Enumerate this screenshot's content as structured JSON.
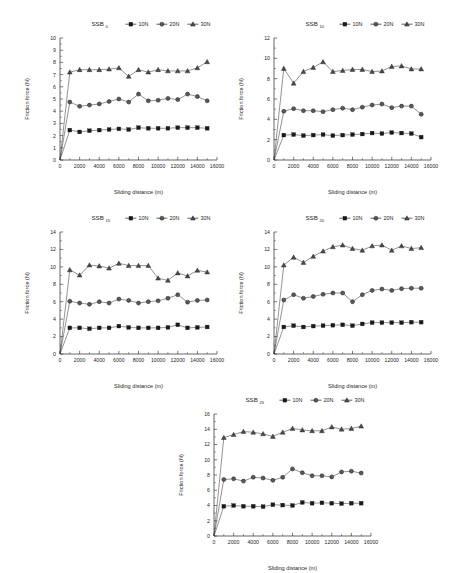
{
  "figure": {
    "axis_titles": {
      "x": "Sliding distance (m)",
      "y": "Friction force (N)"
    },
    "legend": [
      {
        "key": "10N",
        "label": "10N",
        "marker": "square"
      },
      {
        "key": "20N",
        "label": "20N",
        "marker": "circle"
      },
      {
        "key": "30N",
        "label": "30N",
        "marker": "triangle"
      }
    ]
  },
  "chart_data": [
    {
      "type": "line",
      "panel_id": "panel-1",
      "title": "SSB",
      "title_subscript": "0",
      "xlabel": "Sliding distance (m)",
      "ylabel": "Friction force (N)",
      "xlim": [
        0,
        16000
      ],
      "ylim": [
        0,
        10
      ],
      "xticks": [
        0,
        2000,
        4000,
        6000,
        8000,
        10000,
        12000,
        14000,
        16000
      ],
      "yticks": [
        0,
        1,
        2,
        3,
        4,
        5,
        6,
        7,
        8,
        9,
        10
      ],
      "grid": false,
      "legend_position": "top",
      "x": [
        0,
        1000,
        2000,
        3000,
        4000,
        5000,
        6000,
        7000,
        8000,
        9000,
        10000,
        11000,
        12000,
        13000,
        14000,
        15000
      ],
      "series": [
        {
          "name": "10N",
          "marker": "square",
          "values": [
            0,
            2.45,
            2.3,
            2.4,
            2.45,
            2.5,
            2.55,
            2.5,
            2.65,
            2.6,
            2.6,
            2.6,
            2.65,
            2.65,
            2.65,
            2.6
          ]
        },
        {
          "name": "20N",
          "marker": "circle",
          "values": [
            0,
            4.75,
            4.4,
            4.5,
            4.6,
            4.8,
            5.0,
            4.75,
            5.4,
            4.85,
            4.9,
            5.05,
            4.95,
            5.4,
            5.2,
            4.85
          ]
        },
        {
          "name": "30N",
          "marker": "triangle",
          "values": [
            0,
            7.2,
            7.4,
            7.4,
            7.4,
            7.45,
            7.55,
            6.85,
            7.4,
            7.2,
            7.4,
            7.3,
            7.3,
            7.3,
            7.55,
            8.05
          ]
        }
      ]
    },
    {
      "type": "line",
      "panel_id": "panel-2",
      "title": "SSB",
      "title_subscript": "10",
      "xlabel": "Sliding distance (m)",
      "ylabel": "Friction force (N)",
      "xlim": [
        0,
        16000
      ],
      "ylim": [
        0,
        12
      ],
      "xticks": [
        0,
        2000,
        4000,
        6000,
        8000,
        10000,
        12000,
        14000,
        16000
      ],
      "yticks": [
        0,
        2,
        4,
        6,
        8,
        10,
        12
      ],
      "grid": false,
      "legend_position": "top",
      "x": [
        0,
        1000,
        2000,
        3000,
        4000,
        5000,
        6000,
        7000,
        8000,
        9000,
        10000,
        11000,
        12000,
        13000,
        14000,
        15000
      ],
      "series": [
        {
          "name": "10N",
          "marker": "square",
          "values": [
            0,
            2.45,
            2.5,
            2.4,
            2.45,
            2.5,
            2.4,
            2.45,
            2.5,
            2.55,
            2.65,
            2.6,
            2.7,
            2.65,
            2.6,
            2.25
          ]
        },
        {
          "name": "20N",
          "marker": "circle",
          "values": [
            0,
            4.8,
            5.05,
            4.85,
            4.85,
            4.75,
            4.95,
            5.1,
            4.95,
            5.2,
            5.4,
            5.5,
            5.15,
            5.3,
            5.3,
            4.5
          ]
        },
        {
          "name": "30N",
          "marker": "triangle",
          "values": [
            0,
            9.0,
            7.55,
            8.7,
            9.1,
            9.65,
            8.7,
            8.8,
            8.9,
            8.9,
            8.7,
            8.75,
            9.2,
            9.25,
            8.95,
            8.95
          ]
        }
      ]
    },
    {
      "type": "line",
      "panel_id": "panel-3",
      "title": "SSB",
      "title_subscript": "15",
      "xlabel": "Sliding distance (m)",
      "ylabel": "Friction force (N)",
      "xlim": [
        0,
        16000
      ],
      "ylim": [
        0,
        14
      ],
      "xticks": [
        0,
        2000,
        4000,
        6000,
        8000,
        10000,
        12000,
        14000,
        16000
      ],
      "yticks": [
        0,
        2,
        4,
        6,
        8,
        10,
        12,
        14
      ],
      "grid": false,
      "legend_position": "top",
      "x": [
        0,
        1000,
        2000,
        3000,
        4000,
        5000,
        6000,
        7000,
        8000,
        9000,
        10000,
        11000,
        12000,
        13000,
        14000,
        15000
      ],
      "series": [
        {
          "name": "10N",
          "marker": "square",
          "values": [
            0,
            3.0,
            3.0,
            2.9,
            3.0,
            3.0,
            3.2,
            3.05,
            3.0,
            3.0,
            3.0,
            3.05,
            3.35,
            3.0,
            3.05,
            3.1
          ]
        },
        {
          "name": "20N",
          "marker": "circle",
          "values": [
            0,
            6.05,
            5.85,
            5.7,
            6.0,
            5.85,
            6.3,
            6.15,
            5.85,
            6.0,
            6.1,
            6.4,
            6.8,
            5.95,
            6.15,
            6.2
          ]
        },
        {
          "name": "30N",
          "marker": "triangle",
          "values": [
            0,
            9.65,
            9.05,
            10.2,
            10.1,
            9.85,
            10.4,
            10.15,
            10.15,
            10.15,
            8.7,
            8.45,
            9.3,
            8.95,
            9.6,
            9.4
          ]
        }
      ]
    },
    {
      "type": "line",
      "panel_id": "panel-4",
      "title": "SSB",
      "title_subscript": "20",
      "xlabel": "Sliding distance (m)",
      "ylabel": "Friction force (N)",
      "xlim": [
        0,
        16000
      ],
      "ylim": [
        0,
        14
      ],
      "xticks": [
        0,
        2000,
        4000,
        6000,
        8000,
        10000,
        12000,
        14000,
        16000
      ],
      "yticks": [
        0,
        2,
        4,
        6,
        8,
        10,
        12,
        14
      ],
      "grid": false,
      "legend_position": "top",
      "x": [
        0,
        1000,
        2000,
        3000,
        4000,
        5000,
        6000,
        7000,
        8000,
        9000,
        10000,
        11000,
        12000,
        13000,
        14000,
        15000
      ],
      "series": [
        {
          "name": "10N",
          "marker": "square",
          "values": [
            0,
            3.1,
            3.25,
            3.1,
            3.2,
            3.25,
            3.3,
            3.35,
            3.25,
            3.45,
            3.6,
            3.6,
            3.6,
            3.6,
            3.65,
            3.65
          ]
        },
        {
          "name": "20N",
          "marker": "circle",
          "values": [
            0,
            6.2,
            6.8,
            6.4,
            6.6,
            6.85,
            7.0,
            7.0,
            6.0,
            6.8,
            7.3,
            7.45,
            7.3,
            7.5,
            7.55,
            7.55
          ]
        },
        {
          "name": "30N",
          "marker": "triangle",
          "values": [
            0,
            10.2,
            11.1,
            10.5,
            11.2,
            11.8,
            12.3,
            12.5,
            12.1,
            11.9,
            12.4,
            12.5,
            11.9,
            12.4,
            12.1,
            12.2
          ]
        }
      ]
    },
    {
      "type": "line",
      "panel_id": "panel-5",
      "title": "SSB",
      "title_subscript": "25",
      "xlabel": "Sliding distance (m)",
      "ylabel": "Friction force (N)",
      "xlim": [
        0,
        16000
      ],
      "ylim": [
        0,
        16
      ],
      "xticks": [
        0,
        2000,
        4000,
        6000,
        8000,
        10000,
        12000,
        14000,
        16000
      ],
      "yticks": [
        0,
        2,
        4,
        6,
        8,
        10,
        12,
        14,
        16
      ],
      "grid": false,
      "legend_position": "top",
      "x": [
        0,
        1000,
        2000,
        3000,
        4000,
        5000,
        6000,
        7000,
        8000,
        9000,
        10000,
        11000,
        12000,
        13000,
        14000,
        15000
      ],
      "series": [
        {
          "name": "10N",
          "marker": "square",
          "values": [
            0,
            3.9,
            4.0,
            3.9,
            3.9,
            3.85,
            4.1,
            4.05,
            4.0,
            4.4,
            4.3,
            4.35,
            4.3,
            4.25,
            4.3,
            4.3
          ]
        },
        {
          "name": "20N",
          "marker": "circle",
          "values": [
            0,
            7.4,
            7.5,
            7.2,
            7.7,
            7.6,
            7.3,
            7.7,
            8.8,
            8.3,
            7.9,
            7.9,
            7.75,
            8.4,
            8.5,
            8.25
          ]
        },
        {
          "name": "30N",
          "marker": "triangle",
          "values": [
            0,
            12.9,
            13.3,
            13.7,
            13.6,
            13.4,
            13.05,
            13.6,
            14.1,
            13.9,
            13.8,
            13.8,
            14.3,
            14.0,
            14.1,
            14.4
          ]
        }
      ]
    }
  ]
}
